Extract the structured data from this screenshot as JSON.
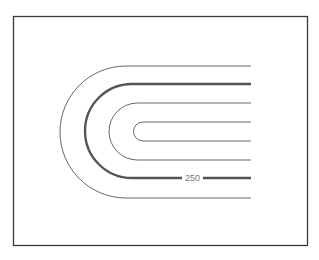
{
  "diagram": {
    "type": "topographic-contour-map",
    "contours": [
      {
        "id": "outer",
        "style": "thin",
        "y_top": 66,
        "y_bottom": 198
      },
      {
        "id": "index",
        "style": "index",
        "y_top": 84,
        "y_bottom": 178,
        "label": "250"
      },
      {
        "id": "third",
        "style": "thin",
        "y_top": 103,
        "y_bottom": 160
      },
      {
        "id": "inner",
        "style": "thin",
        "y_top": 122,
        "y_bottom": 141
      }
    ],
    "index_label": "250",
    "colors": {
      "frame": "#3a3a3a",
      "contour": "#555555",
      "label": "#777777",
      "background": "#ffffff"
    }
  }
}
